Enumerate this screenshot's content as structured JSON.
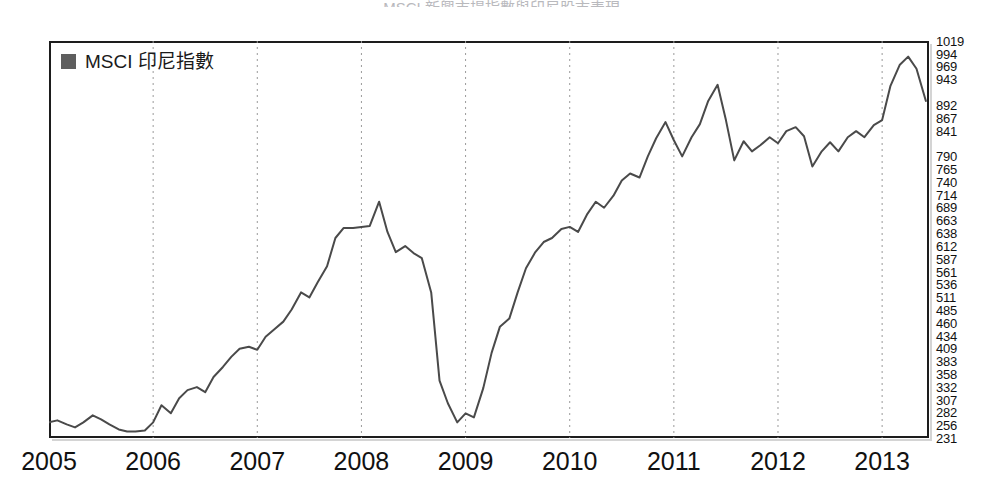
{
  "figure": {
    "title_sliver": "MSCI 新興市場指數與印尼股市表現",
    "background_color": "#ffffff"
  },
  "legend": {
    "position": "top-left-inside",
    "entries": [
      {
        "label": "MSCI 印尼指數",
        "swatch_color": "#5e5e5e",
        "marker": "filled-square"
      }
    ]
  },
  "axes": {
    "frame_color": "#1d1d1d",
    "gridline_color": "#9a9a9a",
    "gridline_style": "dotted-vertical",
    "y_label_side": "right",
    "x_label_side": "bottom"
  },
  "chart_data": {
    "type": "line",
    "title": "",
    "subtitle": "",
    "xlabel": "",
    "ylabel": "",
    "grid": "vertical-dotted-at-year-boundaries",
    "legend_position": "top-left",
    "line_color": "#4a4a4a",
    "line_width": 2,
    "xlim": [
      2005.0,
      2013.45
    ],
    "ylim": [
      231,
      1019
    ],
    "xtick_labels": [
      "2005",
      "2006",
      "2007",
      "2008",
      "2009",
      "2010",
      "2011",
      "2012",
      "2013"
    ],
    "xticks": [
      2005,
      2006,
      2007,
      2008,
      2009,
      2010,
      2011,
      2012,
      2013
    ],
    "ytick_labels": [
      "1019",
      "994",
      "969",
      "943",
      "892",
      "867",
      "841",
      "790",
      "765",
      "740",
      "714",
      "689",
      "663",
      "638",
      "612",
      "587",
      "561",
      "536",
      "511",
      "485",
      "460",
      "434",
      "409",
      "383",
      "358",
      "332",
      "307",
      "282",
      "256",
      "231"
    ],
    "yticks": [
      1019,
      994,
      969,
      943,
      892,
      867,
      841,
      790,
      765,
      740,
      714,
      689,
      663,
      638,
      612,
      587,
      561,
      536,
      511,
      485,
      460,
      434,
      409,
      383,
      358,
      332,
      307,
      282,
      256,
      231
    ],
    "series": [
      {
        "name": "MSCI 印尼指數",
        "x": [
          2005.0,
          2005.08,
          2005.17,
          2005.25,
          2005.33,
          2005.42,
          2005.5,
          2005.58,
          2005.67,
          2005.75,
          2005.83,
          2005.92,
          2006.0,
          2006.08,
          2006.17,
          2006.25,
          2006.33,
          2006.42,
          2006.5,
          2006.58,
          2006.67,
          2006.75,
          2006.83,
          2006.92,
          2007.0,
          2007.08,
          2007.17,
          2007.25,
          2007.33,
          2007.42,
          2007.5,
          2007.58,
          2007.67,
          2007.75,
          2007.83,
          2007.92,
          2008.0,
          2008.08,
          2008.17,
          2008.25,
          2008.33,
          2008.42,
          2008.5,
          2008.58,
          2008.67,
          2008.75,
          2008.83,
          2008.92,
          2009.0,
          2009.08,
          2009.17,
          2009.25,
          2009.33,
          2009.42,
          2009.5,
          2009.58,
          2009.67,
          2009.75,
          2009.83,
          2009.92,
          2010.0,
          2010.08,
          2010.17,
          2010.25,
          2010.33,
          2010.42,
          2010.5,
          2010.58,
          2010.67,
          2010.75,
          2010.83,
          2010.92,
          2011.0,
          2011.08,
          2011.17,
          2011.25,
          2011.33,
          2011.42,
          2011.5,
          2011.58,
          2011.67,
          2011.75,
          2011.83,
          2011.92,
          2012.0,
          2012.08,
          2012.17,
          2012.25,
          2012.33,
          2012.42,
          2012.5,
          2012.58,
          2012.67,
          2012.75,
          2012.83,
          2012.92,
          2013.0,
          2013.08,
          2013.17,
          2013.25,
          2013.33,
          2013.42
        ],
        "values": [
          262,
          266,
          258,
          252,
          262,
          276,
          268,
          258,
          248,
          244,
          244,
          246,
          262,
          296,
          280,
          310,
          326,
          332,
          322,
          352,
          372,
          392,
          408,
          412,
          406,
          432,
          448,
          462,
          486,
          520,
          510,
          540,
          572,
          628,
          648,
          648,
          650,
          652,
          700,
          640,
          600,
          612,
          598,
          588,
          520,
          345,
          300,
          262,
          280,
          272,
          330,
          400,
          452,
          468,
          520,
          568,
          600,
          620,
          628,
          646,
          650,
          640,
          676,
          700,
          688,
          712,
          742,
          756,
          748,
          790,
          826,
          858,
          822,
          790,
          828,
          854,
          900,
          932,
          862,
          782,
          820,
          800,
          812,
          828,
          816,
          840,
          848,
          830,
          770,
          800,
          818,
          800,
          828,
          840,
          828,
          852,
          862,
          930,
          972,
          988,
          964,
          900
        ]
      }
    ],
    "annotations": {
      "peak_2008": {
        "x": 2008.17,
        "y": 700,
        "note": "2008 pre-crisis peak"
      },
      "trough_2008_2009": {
        "x": 2008.92,
        "y": 262,
        "note": "global financial crisis low"
      },
      "peak_2013": {
        "x": 2013.25,
        "y": 988,
        "note": "2013 high"
      },
      "last_point": {
        "x": 2013.42,
        "y": 900
      }
    }
  }
}
